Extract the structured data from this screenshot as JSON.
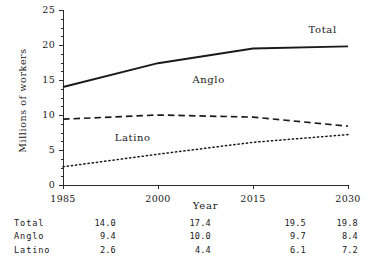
{
  "chart_data": {
    "type": "line",
    "title": "",
    "xlabel": "Year",
    "ylabel": "Millions of workers",
    "x": [
      1985,
      2000,
      2015,
      2030
    ],
    "xtick_labels": [
      "1985",
      "2000",
      "2015",
      "2030"
    ],
    "xlim": [
      1985,
      2030
    ],
    "ylim": [
      0,
      25
    ],
    "ytick_labels": [
      "0",
      "5",
      "10",
      "15",
      "20",
      "25"
    ],
    "ytick_values": [
      0,
      5,
      10,
      15,
      20,
      25
    ],
    "yminor_step": 1.25,
    "grid": false,
    "legend": "inline-annotations",
    "series": [
      {
        "name": "Total",
        "style": "solid",
        "values": [
          14.0,
          17.4,
          19.5,
          19.8
        ],
        "label_x": 2026,
        "label_y": 22.0
      },
      {
        "name": "Anglo",
        "style": "dashed",
        "values": [
          9.4,
          10.0,
          9.7,
          8.4
        ],
        "label_x": 2008,
        "label_y": 14.9
      },
      {
        "name": "Latino",
        "style": "dotted",
        "values": [
          2.6,
          4.4,
          6.1,
          7.2
        ],
        "label_x": 1996,
        "label_y": 6.6
      }
    ]
  },
  "axis": {
    "y_label": "Millions of workers",
    "x_label": "Year",
    "y_ticks": [
      "25",
      "20",
      "15",
      "10",
      "5",
      "0"
    ],
    "x_ticks": [
      "1985",
      "2000",
      "2015",
      "2030"
    ]
  },
  "annotations": {
    "total": "Total",
    "anglo": "Anglo",
    "latino": "Latino"
  },
  "table": {
    "rows": [
      {
        "label": "Total",
        "values": [
          "14.0",
          "17.4",
          "19.5",
          "19.8"
        ]
      },
      {
        "label": "Anglo",
        "values": [
          "9.4",
          "10.0",
          "9.7",
          "8.4"
        ]
      },
      {
        "label": "Latino",
        "values": [
          "2.6",
          "4.4",
          "6.1",
          "7.2"
        ]
      }
    ]
  }
}
